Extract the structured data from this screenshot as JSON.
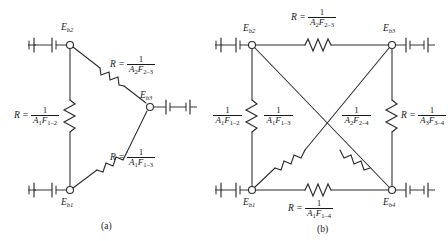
{
  "figure": {
    "panels": [
      {
        "id": "a",
        "caption": "(a)",
        "nodes": [
          {
            "name": "Eb2",
            "label_html": "E",
            "sub": "b2"
          },
          {
            "name": "Eb1",
            "label_html": "E",
            "sub": "b1"
          },
          {
            "name": "Eb3",
            "label_html": "E",
            "sub": "b3"
          }
        ],
        "resistors": [
          {
            "name": "R_A1F12",
            "lhs": "R =",
            "numerator": "1",
            "denominator_A": "A",
            "denominator_A_sub": "1",
            "denominator_F": "F",
            "denominator_F_sub": "1–2"
          },
          {
            "name": "R_A2F23",
            "lhs": "R =",
            "numerator": "1",
            "denominator_A": "A",
            "denominator_A_sub": "2",
            "denominator_F": "F",
            "denominator_F_sub": "2–3"
          },
          {
            "name": "R_A1F13",
            "lhs": "R =",
            "numerator": "1",
            "denominator_A": "A",
            "denominator_A_sub": "1",
            "denominator_F": "F",
            "denominator_F_sub": "1–3"
          }
        ]
      },
      {
        "id": "b",
        "caption": "(b)",
        "nodes": [
          {
            "name": "Eb2",
            "label_html": "E",
            "sub": "b2"
          },
          {
            "name": "Eb3",
            "label_html": "E",
            "sub": "b3"
          },
          {
            "name": "Eb1",
            "label_html": "E",
            "sub": "b1"
          },
          {
            "name": "Eb4",
            "label_html": "E",
            "sub": "b4"
          }
        ],
        "resistors": [
          {
            "name": "R_A2F23_top",
            "lhs": "R =",
            "numerator": "1",
            "denominator_A": "A",
            "denominator_A_sub": "2",
            "denominator_F": "F",
            "denominator_F_sub": "2–3"
          },
          {
            "name": "R_A1F12_left",
            "lhs": "",
            "numerator": "1",
            "denominator_A": "A",
            "denominator_A_sub": "1",
            "denominator_F": "F",
            "denominator_F_sub": "1–2"
          },
          {
            "name": "R_A1F13_diag",
            "lhs": "",
            "numerator": "1",
            "denominator_A": "A",
            "denominator_A_sub": "1",
            "denominator_F": "F",
            "denominator_F_sub": "1–3"
          },
          {
            "name": "R_A2F24_diag",
            "lhs": "",
            "numerator": "1",
            "denominator_A": "A",
            "denominator_A_sub": "2",
            "denominator_F": "F",
            "denominator_F_sub": "2–4"
          },
          {
            "name": "R_A3F34_right",
            "lhs": "R =",
            "numerator": "1",
            "denominator_A": "A",
            "denominator_A_sub": "3",
            "denominator_F": "F",
            "denominator_F_sub": "3–4"
          },
          {
            "name": "R_A1F14_bottom",
            "lhs": "R =",
            "numerator": "1",
            "denominator_A": "A",
            "denominator_A_sub": "1",
            "denominator_F": "F",
            "denominator_F_sub": "1–4"
          }
        ]
      }
    ],
    "colors": {
      "ink": "#2b2b2b",
      "background": "#ffffff"
    }
  }
}
